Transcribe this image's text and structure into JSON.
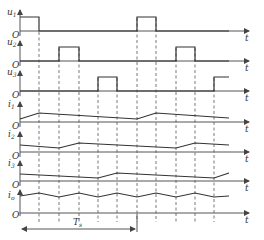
{
  "diagram": {
    "time_axis_label": "t",
    "origin_label": "O",
    "period_label": "T",
    "period_subscript": "s",
    "rows": [
      {
        "id": "u1",
        "label": "u",
        "sub": "1",
        "kind": "pulse"
      },
      {
        "id": "u2",
        "label": "u",
        "sub": "2",
        "kind": "pulse"
      },
      {
        "id": "u3",
        "label": "u",
        "sub": "3",
        "kind": "pulse"
      },
      {
        "id": "i1",
        "label": "i",
        "sub": "1",
        "kind": "current"
      },
      {
        "id": "i2",
        "label": "i",
        "sub": "2",
        "kind": "current"
      },
      {
        "id": "i3",
        "label": "i",
        "sub": "3",
        "kind": "current"
      },
      {
        "id": "i0",
        "label": "i",
        "sub": "o",
        "kind": "ripple"
      }
    ],
    "colors": {
      "line": "#333333",
      "axis": "#555555",
      "background": "#ffffff"
    }
  }
}
